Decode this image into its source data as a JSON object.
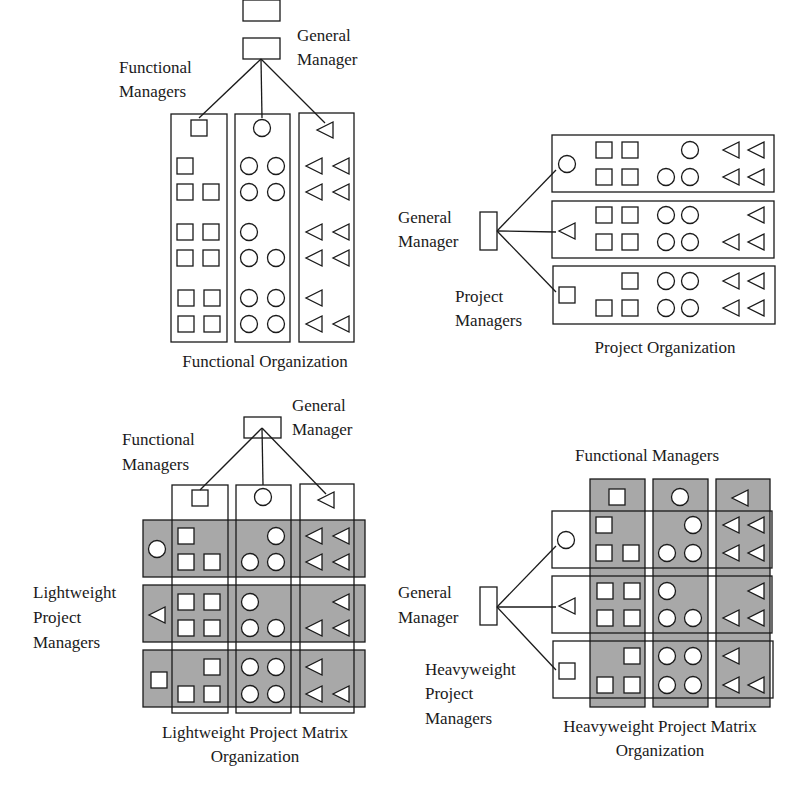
{
  "colors": {
    "line": "#1a1a1a",
    "shade": "#a8a8a8",
    "background": "#ffffff"
  },
  "panels": [
    {
      "id": "functional",
      "caption": "Functional Organization",
      "labels": {
        "gm_line1": "General",
        "gm_line2": "Manager",
        "fm_line1": "Functional",
        "fm_line2": "Managers"
      },
      "columns": [
        {
          "function": "square",
          "rows": [
            [
              1,
              0
            ],
            [
              1,
              1
            ],
            [
              1,
              1
            ],
            [
              1,
              1
            ],
            [
              1,
              1
            ],
            [
              1,
              1
            ]
          ]
        },
        {
          "function": "circle",
          "rows": [
            [
              1,
              1
            ],
            [
              1,
              1
            ],
            [
              1,
              0
            ],
            [
              1,
              1
            ],
            [
              1,
              1
            ],
            [
              1,
              1
            ]
          ]
        },
        {
          "function": "triangle",
          "rows": [
            [
              1,
              1
            ],
            [
              1,
              1
            ],
            [
              1,
              1
            ],
            [
              1,
              1
            ],
            [
              1,
              0
            ],
            [
              1,
              1
            ]
          ]
        }
      ]
    },
    {
      "id": "project",
      "caption": "Project Organization",
      "labels": {
        "gm_line1": "General",
        "gm_line2": "Manager",
        "pm_line1": "Project",
        "pm_line2": "Managers"
      },
      "project_leads": [
        "circle",
        "triangle",
        "square"
      ]
    },
    {
      "id": "lightweight",
      "caption_line1": "Lightweight Project Matrix",
      "caption_line2": "Organization",
      "labels": {
        "gm_line1": "General",
        "gm_line2": "Manager",
        "fm_line1": "Functional",
        "fm_line2": "Managers",
        "pm_line1": "Lightweight",
        "pm_line2": "Project",
        "pm_line3": "Managers"
      },
      "project_leads": [
        "circle",
        "triangle",
        "square"
      ],
      "shaded": "project-rows"
    },
    {
      "id": "heavyweight",
      "caption_line1": "Heavyweight Project Matrix",
      "caption_line2": "Organization",
      "labels": {
        "fm": "Functional Managers",
        "gm_line1": "General",
        "gm_line2": "Manager",
        "pm_line1": "Heavyweight",
        "pm_line2": "Project",
        "pm_line3": "Managers"
      },
      "project_leads": [
        "circle",
        "triangle",
        "square"
      ],
      "shaded": "function-columns"
    }
  ]
}
